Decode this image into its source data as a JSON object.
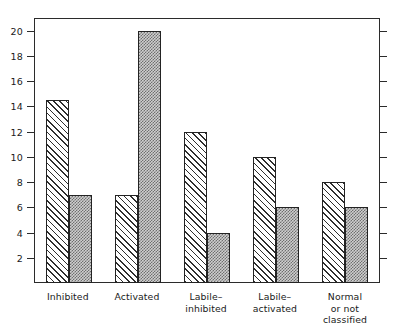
{
  "chart_data": {
    "type": "bar",
    "title": "",
    "subtitle": "",
    "xlabel": "",
    "ylabel": "",
    "ylim": [
      0,
      21
    ],
    "yticks": [
      2,
      4,
      6,
      8,
      10,
      12,
      14,
      16,
      18,
      20
    ],
    "ytick_labels": [
      "2",
      "4",
      "6",
      "8",
      "10",
      "12",
      "14",
      "16",
      "18",
      "20"
    ],
    "grid": false,
    "legend": null,
    "legend_position": "none",
    "frame": "box",
    "mirrored_right_ticks": true,
    "categories": [
      "Inhibited",
      "Activated",
      "Labile–\ninhibited",
      "Labile–\nactivated",
      "Normal\nor not\nclassified"
    ],
    "series": [
      {
        "name": "series-1",
        "pattern": "diagonal-hatch",
        "fill": "#ffffff",
        "hatch_color": "#2e2e2e",
        "values": [
          14.5,
          7,
          12,
          10,
          8
        ]
      },
      {
        "name": "series-2",
        "pattern": "gray-stipple",
        "fill": "#9a9a9a",
        "hatch_color": "#6f6f6f",
        "values": [
          7,
          20,
          4,
          6,
          6
        ]
      }
    ],
    "colors": {
      "axis": "#2b2b2b",
      "bar_outline": "#232323",
      "background": "#ffffff",
      "text": "#1a1a1a"
    }
  }
}
